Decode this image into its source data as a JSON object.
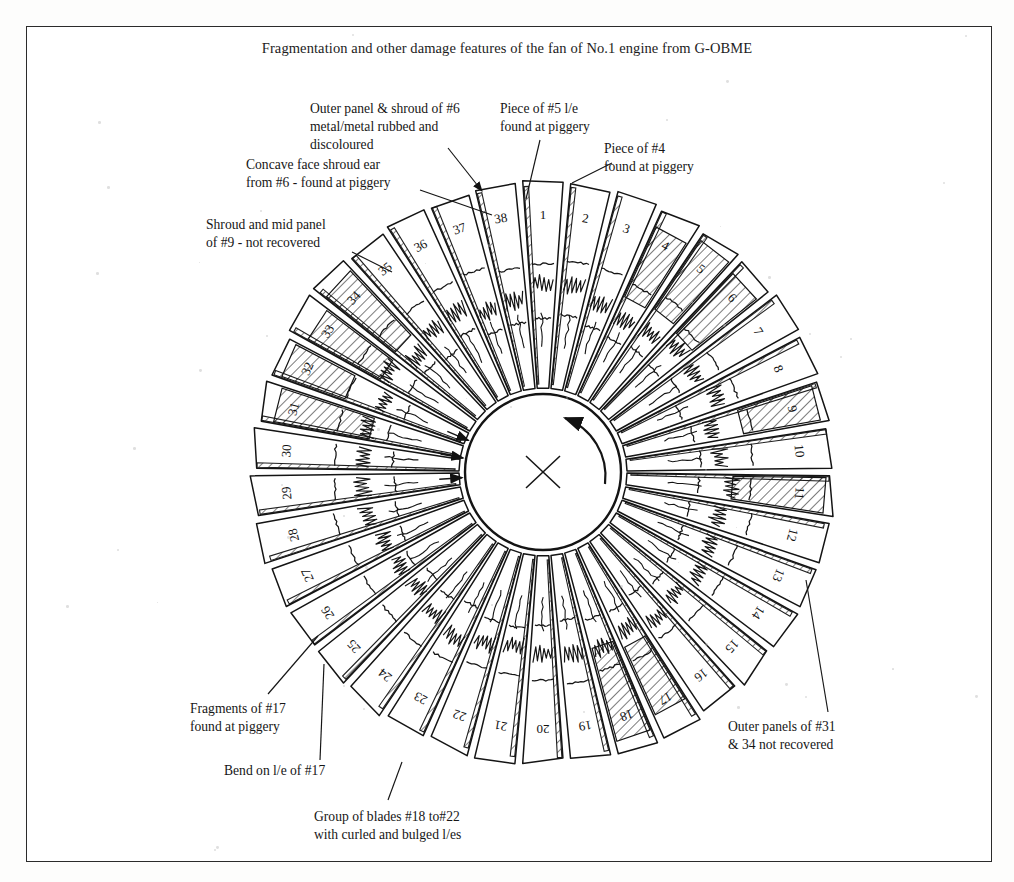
{
  "document": {
    "title": "Fragmentation and other damage features of the fan of No.1 engine from G-OBME",
    "page_background": "#ffffff",
    "ink_color": "#1a1a1a",
    "frame": {
      "present": true,
      "color": "#2b2b2b"
    }
  },
  "diagram": {
    "name": "fan-disc-assembly",
    "blade_count": 38,
    "hub": {
      "centre_mark": "x-cross-mark",
      "rotation_arrow": "counter-clockwise-arrow",
      "radial_tick_arrows": 3
    },
    "blade_numbers": [
      "1",
      "2",
      "3",
      "4",
      "5",
      "6",
      "7",
      "8",
      "9",
      "10",
      "11",
      "12",
      "13",
      "14",
      "15",
      "16",
      "17",
      "18",
      "19",
      "20",
      "21",
      "22",
      "23",
      "24",
      "25",
      "26",
      "27",
      "28",
      "29",
      "30",
      "31",
      "32",
      "33",
      "34",
      "35",
      "36",
      "37",
      "38"
    ],
    "hatched_blades": [
      4,
      5,
      6,
      9,
      11,
      17,
      18,
      31,
      32,
      33,
      34
    ],
    "geometry": {
      "centre_x": 543,
      "centre_y": 472,
      "hub_radius": 78,
      "blade_root_radius": 84,
      "blade_tip_radius": 290,
      "start_angle_deg": -90
    }
  },
  "annotations": [
    {
      "id": "outer-panel-shroud-6",
      "text": "Outer panel & shroud of #6\nmetal/metal rubbed and\ndiscoloured",
      "x": 310,
      "y": 100,
      "align": "left",
      "leader": {
        "x1": 448,
        "y1": 148,
        "x2": 482,
        "y2": 191,
        "arrow": true
      }
    },
    {
      "id": "concave-face-shroud-ear-6",
      "text": "Concave face shroud ear\nfrom #6 - found at piggery",
      "x": 246,
      "y": 156,
      "align": "left",
      "leader": {
        "x1": 420,
        "y1": 190,
        "x2": 492,
        "y2": 215,
        "arrow": false
      }
    },
    {
      "id": "piece-of-5-le",
      "text": "Piece of #5 l/e\nfound at piggery",
      "x": 500,
      "y": 100,
      "align": "left",
      "leader": {
        "x1": 540,
        "y1": 140,
        "x2": 526,
        "y2": 199,
        "arrow": false
      }
    },
    {
      "id": "piece-of-4",
      "text": "Piece of #4\nfound at piggery",
      "x": 604,
      "y": 140,
      "align": "left",
      "leader": {
        "x1": 612,
        "y1": 163,
        "x2": 572,
        "y2": 183,
        "arrow": false
      }
    },
    {
      "id": "shroud-mid-panel-9",
      "text": "Shroud and mid panel\nof #9 - not recovered",
      "x": 206,
      "y": 216,
      "align": "left",
      "leader": {
        "x1": 352,
        "y1": 252,
        "x2": 392,
        "y2": 272,
        "arrow": false
      }
    },
    {
      "id": "fragments-of-17",
      "text": "Fragments of #17\nfound at piggery",
      "x": 190,
      "y": 700,
      "align": "left",
      "leader": {
        "x1": 268,
        "y1": 694,
        "x2": 318,
        "y2": 636,
        "arrow": false
      }
    },
    {
      "id": "bend-on-le-of-17",
      "text": "Bend on l/e of #17",
      "x": 224,
      "y": 762,
      "align": "left",
      "leader": {
        "x1": 320,
        "y1": 760,
        "x2": 324,
        "y2": 664,
        "arrow": false
      }
    },
    {
      "id": "group-of-blades-18-22",
      "text": "Group of blades #18 to#22\nwith curled and bulged l/es",
      "x": 314,
      "y": 808,
      "align": "left",
      "leader": {
        "x1": 388,
        "y1": 800,
        "x2": 402,
        "y2": 762,
        "arrow": false
      }
    },
    {
      "id": "outer-panels-31-34",
      "text": "Outer panels of #31\n& 34 not recovered",
      "x": 728,
      "y": 718,
      "align": "left",
      "leader": {
        "x1": 828,
        "y1": 712,
        "x2": 806,
        "y2": 580,
        "arrow": false
      }
    }
  ]
}
